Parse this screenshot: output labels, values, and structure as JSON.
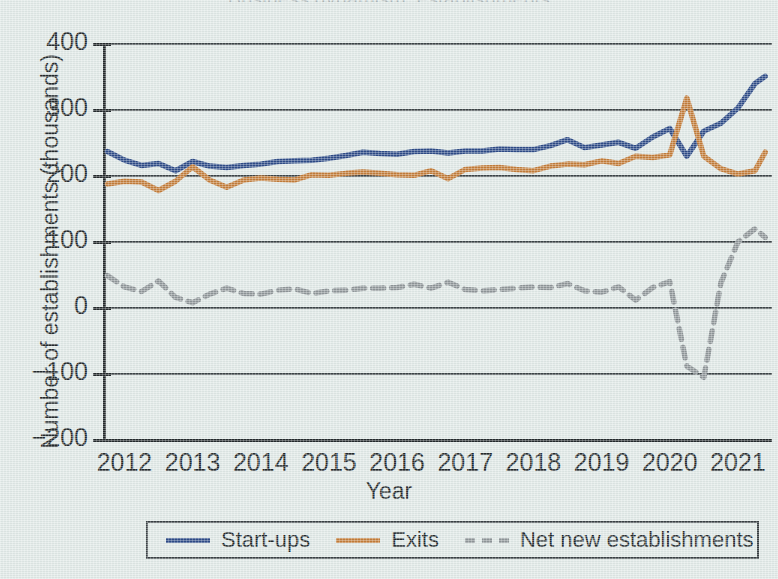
{
  "figure": {
    "background_color": "#dfe8e6",
    "axis_color": "#22282b",
    "gridline_color": "#3d4548",
    "cropped_title": "Business dynamism, establishments"
  },
  "legend": {
    "position": "below-axes",
    "items": [
      {
        "label": "Start-ups",
        "color": "#2d4b87",
        "style": "solid",
        "icon": "line-swatch-icon"
      },
      {
        "label": "Exits",
        "color": "#c27c3a",
        "style": "solid",
        "icon": "line-swatch-icon"
      },
      {
        "label": "Net new establishments",
        "color": "#8f9699",
        "style": "dashed",
        "icon": "dashed-line-swatch-icon"
      }
    ]
  },
  "chart_data": {
    "type": "line",
    "title": "",
    "xlabel": "Year",
    "ylabel": "Number of establishments  (thousands)",
    "xlim": [
      2011.7,
      2021.5
    ],
    "ylim": [
      -200,
      400
    ],
    "ytick_values": [
      400,
      300,
      200,
      100,
      0,
      -100,
      -200
    ],
    "ytick_labels": [
      "400",
      "300",
      "200",
      "100",
      "0",
      "−100",
      "−200"
    ],
    "xtick_values": [
      2012,
      2013,
      2014,
      2015,
      2016,
      2017,
      2018,
      2019,
      2020,
      2021
    ],
    "xtick_labels": [
      "2012",
      "2013",
      "2014",
      "2015",
      "2016",
      "2017",
      "2018",
      "2019",
      "2020",
      "2021"
    ],
    "grid": "horizontal",
    "x": [
      2011.75,
      2012.0,
      2012.25,
      2012.5,
      2012.75,
      2013.0,
      2013.25,
      2013.5,
      2013.75,
      2014.0,
      2014.25,
      2014.5,
      2014.75,
      2015.0,
      2015.25,
      2015.5,
      2015.75,
      2016.0,
      2016.25,
      2016.5,
      2016.75,
      2017.0,
      2017.25,
      2017.5,
      2017.75,
      2018.0,
      2018.25,
      2018.5,
      2018.75,
      2019.0,
      2019.25,
      2019.5,
      2019.75,
      2020.0,
      2020.25,
      2020.5,
      2020.75,
      2021.0,
      2021.25,
      2021.4
    ],
    "series": [
      {
        "name": "Start-ups",
        "color": "#2d4b87",
        "style": "solid",
        "values": [
          237,
          224,
          216,
          219,
          208,
          222,
          215,
          213,
          216,
          218,
          222,
          223,
          224,
          227,
          231,
          236,
          234,
          233,
          237,
          238,
          235,
          238,
          238,
          241,
          240,
          240,
          246,
          255,
          243,
          247,
          251,
          242,
          259,
          272,
          230,
          268,
          280,
          303,
          340,
          351
        ]
      },
      {
        "name": "Exits",
        "color": "#c27c3a",
        "style": "solid",
        "values": [
          188,
          192,
          191,
          178,
          192,
          214,
          194,
          183,
          194,
          197,
          195,
          194,
          202,
          201,
          204,
          206,
          204,
          202,
          201,
          208,
          196,
          210,
          212,
          213,
          210,
          208,
          215,
          218,
          217,
          223,
          219,
          230,
          228,
          232,
          318,
          230,
          211,
          203,
          208,
          236
        ]
      },
      {
        "name": "Net new establishments",
        "color": "#8f9699",
        "style": "dashed",
        "values": [
          49,
          32,
          25,
          41,
          16,
          8,
          21,
          30,
          22,
          21,
          27,
          29,
          22,
          26,
          27,
          30,
          30,
          31,
          36,
          30,
          39,
          28,
          26,
          28,
          30,
          32,
          31,
          37,
          26,
          24,
          32,
          12,
          31,
          40,
          -88,
          -105,
          38,
          100,
          120,
          107
        ]
      }
    ]
  }
}
